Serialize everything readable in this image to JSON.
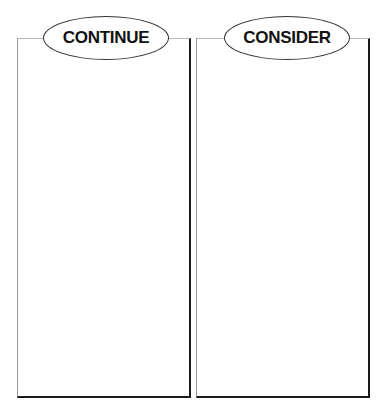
{
  "panels": [
    {
      "title": "CONTINUE"
    },
    {
      "title": "CONSIDER"
    }
  ]
}
